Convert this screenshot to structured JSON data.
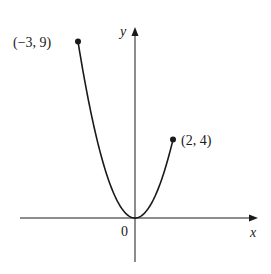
{
  "chart_data": {
    "type": "line",
    "title": "",
    "function": "y = x^2",
    "domain": [
      -3,
      2
    ],
    "x": [
      -3,
      -2.5,
      -2,
      -1.5,
      -1,
      -0.5,
      0,
      0.5,
      1,
      1.5,
      2
    ],
    "series": [
      {
        "name": "y = x^2",
        "values": [
          9,
          6.25,
          4,
          2.25,
          1,
          0.25,
          0,
          0.25,
          1,
          2.25,
          4
        ]
      }
    ],
    "endpoints": [
      {
        "x": -3,
        "y": 9,
        "label": "(−3, 9)"
      },
      {
        "x": 2,
        "y": 4,
        "label": "(2, 4)"
      }
    ],
    "xlabel": "x",
    "ylabel": "y",
    "origin_label": "0",
    "grid": false,
    "legend": "none",
    "colors": {
      "curve": "#1a1a1a",
      "axes": "#1a1a1a",
      "background": "#ffffff"
    }
  },
  "labels": {
    "x_axis": "x",
    "y_axis": "y",
    "origin": "0",
    "point_left": "(−3, 9)",
    "point_right": "(2, 4)"
  }
}
